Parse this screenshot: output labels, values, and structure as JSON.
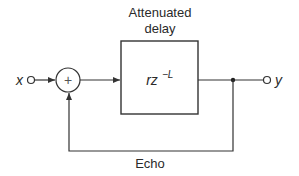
{
  "diagram": {
    "type": "block-diagram",
    "title_label": {
      "line1": "Attenuated",
      "line2": "delay"
    },
    "input": {
      "label": "x"
    },
    "summer": {
      "symbol": "+"
    },
    "block": {
      "transfer_base": "rz",
      "transfer_exponent": "−L"
    },
    "output": {
      "label": "y"
    },
    "feedback": {
      "label": "Echo"
    },
    "colors": {
      "stroke": "#333333",
      "text": "#2a2a2a",
      "background": "#ffffff"
    }
  }
}
